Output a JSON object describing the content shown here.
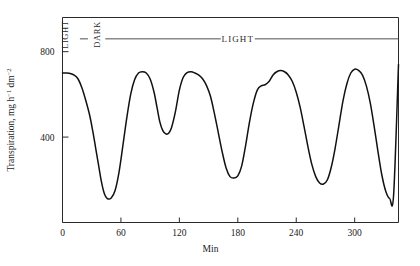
{
  "chart_data": {
    "type": "line",
    "title": "",
    "subtitle": "",
    "xlabel": "Min",
    "ylabel": "Transpiration, mg h−1 dm−2",
    "ylabel_parts": {
      "base": "Transpiration, mg h",
      "sup1": "−1",
      "mid": " dm",
      "sup2": "−2"
    },
    "xlim": [
      0,
      345
    ],
    "ylim": [
      0,
      960
    ],
    "xticks": [
      0,
      60,
      120,
      180,
      240,
      300
    ],
    "xtick_labels": [
      "0",
      "60",
      "120",
      "180",
      "240",
      "300"
    ],
    "yticks": [
      400,
      800
    ],
    "ytick_labels": [
      "400",
      "800"
    ],
    "grid": false,
    "legend": "none",
    "series": [
      {
        "name": "Transpiration rate",
        "color": "#111111",
        "x": [
          0,
          4,
          8,
          12,
          16,
          20,
          24,
          28,
          31,
          34,
          37,
          40,
          43,
          46,
          50,
          54,
          58,
          62,
          66,
          70,
          74,
          78,
          82,
          86,
          90,
          94,
          97,
          100,
          103,
          106,
          109,
          112,
          116,
          120,
          124,
          128,
          132,
          136,
          140,
          144,
          148,
          152,
          156,
          160,
          164,
          168,
          172,
          176,
          180,
          184,
          188,
          192,
          196,
          200,
          204,
          208,
          212,
          216,
          220,
          224,
          228,
          232,
          236,
          240,
          244,
          248,
          252,
          256,
          260,
          264,
          268,
          272,
          276,
          280,
          284,
          288,
          292,
          296,
          300,
          304,
          308,
          312,
          316,
          320,
          324,
          328,
          332,
          336,
          340,
          345
        ],
        "y": [
          700,
          700,
          698,
          690,
          672,
          630,
          570,
          500,
          430,
          350,
          270,
          190,
          135,
          112,
          115,
          150,
          235,
          360,
          490,
          600,
          668,
          700,
          706,
          700,
          672,
          610,
          540,
          470,
          430,
          415,
          418,
          445,
          520,
          620,
          680,
          702,
          706,
          700,
          690,
          672,
          640,
          590,
          510,
          420,
          330,
          255,
          215,
          208,
          218,
          265,
          360,
          470,
          560,
          620,
          640,
          645,
          660,
          690,
          706,
          712,
          706,
          690,
          660,
          610,
          540,
          450,
          355,
          272,
          215,
          185,
          180,
          200,
          260,
          350,
          460,
          570,
          650,
          700,
          718,
          712,
          690,
          640,
          560,
          450,
          330,
          220,
          145,
          112,
          130,
          740
        ]
      }
    ],
    "annotations": [
      {
        "name": "light-label-left",
        "text": "LIGHT",
        "orientation": "vertical",
        "x_min": 6,
        "y_value": 880
      },
      {
        "name": "dark-label",
        "text": "DARK",
        "orientation": "vertical",
        "x_min": 38,
        "y_value": 880
      },
      {
        "name": "light-label-span",
        "text": "LIGHT",
        "orientation": "horizontal",
        "x_min": 180,
        "y_value": 860
      }
    ],
    "regime_bar": {
      "y_value": 860,
      "segment_start_min": 44,
      "segment_end_min": 345,
      "gap_label": "LIGHT"
    }
  }
}
